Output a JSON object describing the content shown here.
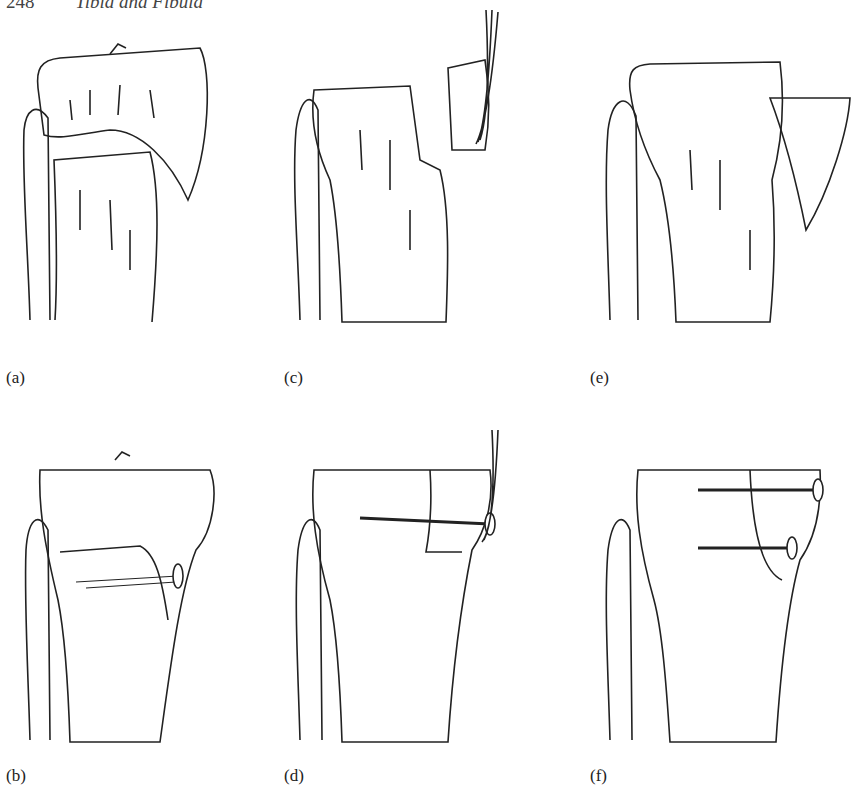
{
  "header": {
    "page_number": "248",
    "running_title": "Tibia and Fibula"
  },
  "panels": [
    {
      "id": "a",
      "label": "(a)"
    },
    {
      "id": "b",
      "label": "(b)"
    },
    {
      "id": "c",
      "label": "(c)"
    },
    {
      "id": "d",
      "label": "(d)"
    },
    {
      "id": "e",
      "label": "(e)"
    },
    {
      "id": "f",
      "label": "(f)"
    }
  ]
}
